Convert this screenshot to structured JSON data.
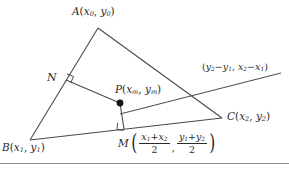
{
  "figure": {
    "type": "geometry-diagram",
    "width": 289,
    "height": 171,
    "stroke_color": "#4a4a4a",
    "text_color": "#2b2b2b",
    "background": "#ffffff"
  },
  "labels": {
    "vertex_a": {
      "name": "A",
      "sub0": "0",
      "x": "x",
      "y": "y"
    },
    "vertex_b": {
      "name": "B",
      "sub": "1",
      "x": "x",
      "y": "y"
    },
    "vertex_c": {
      "name": "C",
      "sub": "2",
      "x": "x",
      "y": "y"
    },
    "point_n": {
      "name": "N"
    },
    "point_p": {
      "name": "P",
      "sub": "m",
      "x": "x",
      "y": "y"
    },
    "point_m": {
      "name": "M",
      "num_x": "x",
      "num_x_sub1": "1",
      "num_x_plus": "+",
      "num_x_sub2": "2",
      "den_x": "2",
      "num_y": "y",
      "num_y_sub1": "1",
      "num_y_plus": "+",
      "num_y_sub2": "2",
      "den_y": "2",
      "comma": ","
    },
    "direction_vector": {
      "open": "(",
      "y": "y",
      "sub2a": "2",
      "minus1": "−",
      "sub1a": "1",
      "comma": ",",
      "x": "x",
      "sub2b": "2",
      "minus2": "−",
      "sub1b": "1",
      "close": ")"
    },
    "paren_open": "(",
    "paren_close": ")",
    "comma": ","
  },
  "geometry": {
    "vertices": {
      "A": [
        98,
        28
      ],
      "B": [
        30,
        140
      ],
      "C": [
        222,
        118
      ],
      "N": [
        66,
        80
      ],
      "P": [
        120,
        103
      ],
      "M": [
        124,
        129
      ]
    },
    "segments": [
      {
        "name": "side-ab",
        "from": "A",
        "to": "B"
      },
      {
        "name": "side-ac",
        "from": "A",
        "to": "C"
      },
      {
        "name": "side-bc",
        "from": "B",
        "to": "C"
      },
      {
        "name": "perpendicular-np",
        "from": "N",
        "to": "P"
      },
      {
        "name": "perpendicular-pm",
        "from": "P",
        "to": "M"
      },
      {
        "name": "direction-ray",
        "from": "P",
        "to": [
          280,
          72
        ]
      }
    ],
    "right_angles": [
      "at-N",
      "at-M"
    ],
    "marked_points": [
      "P"
    ]
  }
}
